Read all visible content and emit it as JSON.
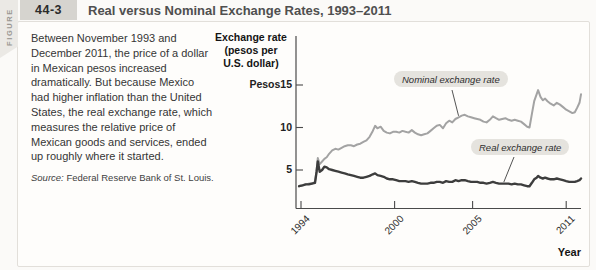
{
  "header": {
    "figure_label": "FIGURE",
    "figure_number": "44-3",
    "title": "Real versus Nominal Exchange Rates, 1993–2011"
  },
  "caption": {
    "body": "Between November 1993 and December 2011, the price of a dollar in Mexican pesos increased dramatically. But because Mexico had higher inflation than the United States, the real exchange rate, which measures the relative price of Mexican goods and services, ended up roughly where it started.",
    "source_label": "Source:",
    "source_text": "Federal Reserve Bank of St. Louis."
  },
  "colors": {
    "nominal_line": "#a3a3a3",
    "real_line": "#3d3d3d",
    "axis": "#4a4a4a",
    "label_chip_bg": "#e5e3de",
    "figure_number_bg": "#d6d4cf",
    "figure_strip_bg": "#ebe9e5"
  },
  "chart_data": {
    "type": "line",
    "title": "Real versus Nominal Exchange Rates, 1993–2011",
    "xlabel": "Year",
    "ylabel": "Exchange rate (pesos per U.S. dollar)",
    "ylabel_lines": [
      "Exchange rate",
      "(pesos per",
      "U.S. dollar)"
    ],
    "y_ticks": [
      15,
      10,
      5
    ],
    "y_tick_labels": [
      "Pesos15",
      "10",
      "5"
    ],
    "x_ticks": [
      1994,
      2000,
      2005,
      2011
    ],
    "x_tick_labels": [
      "1994",
      "2000",
      "2005",
      "2011"
    ],
    "xlim": [
      1993.8,
      2012.0
    ],
    "ylim": [
      0.5,
      15.8
    ],
    "grid": false,
    "legend_position": "callout-labels",
    "x": [
      1993.88,
      1994.1,
      1994.3,
      1994.5,
      1994.7,
      1994.9,
      1995.0,
      1995.08,
      1995.2,
      1995.35,
      1995.5,
      1995.65,
      1995.8,
      1996.0,
      1996.2,
      1996.4,
      1996.6,
      1996.8,
      1997.0,
      1997.2,
      1997.4,
      1997.6,
      1997.8,
      1998.0,
      1998.2,
      1998.4,
      1998.6,
      1998.75,
      1998.9,
      1999.1,
      1999.3,
      1999.5,
      1999.7,
      1999.9,
      2000.1,
      2000.3,
      2000.5,
      2000.7,
      2000.9,
      2001.1,
      2001.3,
      2001.5,
      2001.7,
      2001.9,
      2002.1,
      2002.3,
      2002.5,
      2002.7,
      2002.9,
      2003.1,
      2003.3,
      2003.5,
      2003.7,
      2003.9,
      2004.1,
      2004.3,
      2004.5,
      2004.7,
      2004.9,
      2005.1,
      2005.3,
      2005.5,
      2005.7,
      2005.9,
      2006.1,
      2006.3,
      2006.5,
      2006.7,
      2006.9,
      2007.1,
      2007.3,
      2007.5,
      2007.7,
      2007.9,
      2008.1,
      2008.3,
      2008.5,
      2008.65,
      2008.8,
      2008.95,
      2009.1,
      2009.2,
      2009.35,
      2009.5,
      2009.65,
      2009.8,
      2010.0,
      2010.2,
      2010.4,
      2010.6,
      2010.8,
      2011.0,
      2011.2,
      2011.4,
      2011.55,
      2011.7,
      2011.85,
      2011.95
    ],
    "series": [
      {
        "name": "Nominal exchange rate",
        "color": "#a3a3a3",
        "width": 2,
        "callout_anchor_year": 2004.1,
        "values": [
          3.1,
          3.2,
          3.3,
          3.4,
          3.4,
          3.6,
          4.9,
          6.4,
          5.7,
          6.0,
          6.3,
          6.5,
          6.9,
          7.3,
          7.5,
          7.4,
          7.6,
          7.8,
          7.9,
          7.9,
          7.8,
          8.0,
          8.1,
          8.3,
          8.5,
          8.9,
          9.6,
          10.2,
          9.9,
          10.1,
          9.6,
          9.4,
          9.3,
          9.5,
          9.5,
          9.4,
          9.6,
          9.5,
          9.4,
          9.7,
          9.4,
          9.2,
          9.1,
          9.2,
          9.3,
          9.6,
          9.9,
          10.2,
          10.3,
          9.9,
          10.5,
          10.8,
          10.6,
          11.0,
          11.2,
          11.4,
          11.5,
          11.3,
          11.2,
          11.1,
          11.0,
          10.9,
          10.7,
          10.6,
          10.9,
          11.3,
          11.1,
          10.9,
          11.0,
          11.1,
          10.9,
          10.8,
          10.9,
          10.8,
          10.7,
          10.4,
          10.1,
          10.0,
          11.6,
          13.1,
          13.9,
          14.4,
          13.6,
          13.2,
          13.4,
          13.1,
          12.8,
          12.6,
          12.9,
          12.7,
          12.4,
          12.1,
          11.9,
          11.7,
          11.8,
          12.3,
          12.9,
          13.9
        ]
      },
      {
        "name": "Real exchange rate",
        "color": "#3d3d3d",
        "width": 2.4,
        "callout_anchor_year": 2007.0,
        "values": [
          3.1,
          3.2,
          3.3,
          3.3,
          3.4,
          3.5,
          4.8,
          6.0,
          4.8,
          5.0,
          5.4,
          5.3,
          5.1,
          5.0,
          4.9,
          4.8,
          4.7,
          4.6,
          4.5,
          4.4,
          4.3,
          4.2,
          4.1,
          4.1,
          4.2,
          4.3,
          4.5,
          4.6,
          4.4,
          4.3,
          4.2,
          4.0,
          3.9,
          3.9,
          3.8,
          3.7,
          3.7,
          3.7,
          3.6,
          3.7,
          3.6,
          3.5,
          3.4,
          3.4,
          3.4,
          3.5,
          3.5,
          3.6,
          3.6,
          3.5,
          3.7,
          3.6,
          3.6,
          3.8,
          3.7,
          3.8,
          3.8,
          3.7,
          3.6,
          3.6,
          3.6,
          3.5,
          3.5,
          3.4,
          3.5,
          3.6,
          3.5,
          3.4,
          3.4,
          3.4,
          3.4,
          3.3,
          3.4,
          3.3,
          3.3,
          3.2,
          3.1,
          3.1,
          3.5,
          3.9,
          4.1,
          4.3,
          4.1,
          4.0,
          4.1,
          4.0,
          3.9,
          3.9,
          4.0,
          3.9,
          3.8,
          3.7,
          3.6,
          3.6,
          3.6,
          3.7,
          3.8,
          4.0
        ]
      }
    ]
  }
}
